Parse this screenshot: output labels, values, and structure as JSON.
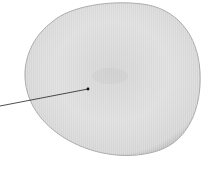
{
  "figure": {
    "colors": {
      "background": "#ffffff",
      "cell_fill": "#d9d9d9",
      "cell_center": "#cfcfcf",
      "cell_edge": "#a8a8a8",
      "pointer": "#222222"
    },
    "pointer": {
      "start": [
        0,
        106
      ],
      "end": [
        88,
        89
      ]
    }
  }
}
